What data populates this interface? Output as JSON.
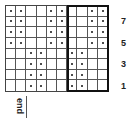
{
  "chart": {
    "type": "knitting-chart",
    "columns": 10,
    "rows_count": 8,
    "rows": [
      [
        1,
        1,
        0,
        0,
        1,
        1,
        0,
        0,
        1,
        1
      ],
      [
        1,
        1,
        0,
        0,
        1,
        1,
        0,
        0,
        1,
        1
      ],
      [
        1,
        1,
        0,
        0,
        1,
        1,
        0,
        0,
        1,
        1
      ],
      [
        1,
        1,
        0,
        0,
        1,
        1,
        0,
        0,
        1,
        1
      ],
      [
        0,
        0,
        1,
        1,
        0,
        0,
        1,
        1,
        0,
        0
      ],
      [
        0,
        0,
        1,
        1,
        0,
        0,
        1,
        1,
        0,
        0
      ],
      [
        0,
        0,
        1,
        1,
        0,
        0,
        1,
        1,
        0,
        0
      ],
      [
        0,
        0,
        1,
        1,
        0,
        0,
        1,
        1,
        0,
        0
      ]
    ],
    "repeat_box": {
      "start_col": 7,
      "end_col": 10
    },
    "row_numbers": [
      {
        "label": "7",
        "top": 16
      },
      {
        "label": "5",
        "top": 38
      },
      {
        "label": "3",
        "top": 59
      },
      {
        "label": "1",
        "top": 81
      }
    ],
    "end_label": "end"
  }
}
